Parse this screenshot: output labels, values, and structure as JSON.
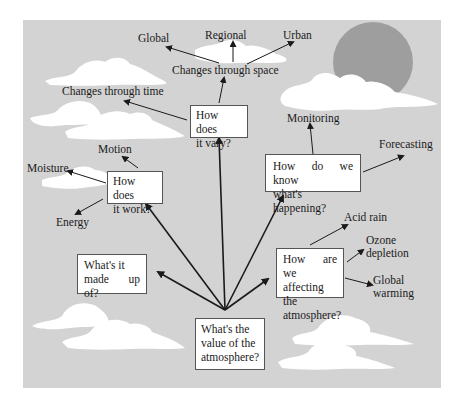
{
  "diagram": {
    "type": "concept-map",
    "central_question": [
      "What's the",
      "value of the",
      "atmosphere?"
    ],
    "questions": [
      {
        "id": "made_up_of",
        "lines": [
          "What's it",
          "made up of?"
        ]
      },
      {
        "id": "work",
        "lines": [
          "How does",
          "it work?"
        ]
      },
      {
        "id": "vary",
        "lines": [
          "How does",
          "it vary?"
        ]
      },
      {
        "id": "know",
        "lines": [
          "How do we know",
          "what's happening?"
        ]
      },
      {
        "id": "affect",
        "lines": [
          "How are we",
          "affecting the",
          "atmosphere?"
        ]
      }
    ],
    "labels": {
      "work": {
        "motion": "Motion",
        "moisture": "Moisture",
        "energy": "Energy"
      },
      "vary": {
        "time": "Changes through time",
        "space": "Changes through space"
      },
      "space": {
        "global": "Global",
        "regional": "Regional",
        "urban": "Urban"
      },
      "know": {
        "monitoring": "Monitoring",
        "forecasting": "Forecasting"
      },
      "affect": {
        "acid_rain": "Acid rain",
        "ozone": [
          "Ozone",
          "depletion"
        ],
        "warming": [
          "Global",
          "warming"
        ]
      }
    },
    "colors": {
      "background": "#d3d3d3",
      "sun": "#9e9e9e",
      "cloud": "#ffffff",
      "box_fill": "#ffffff",
      "arrow": "#1a1a1a"
    }
  }
}
